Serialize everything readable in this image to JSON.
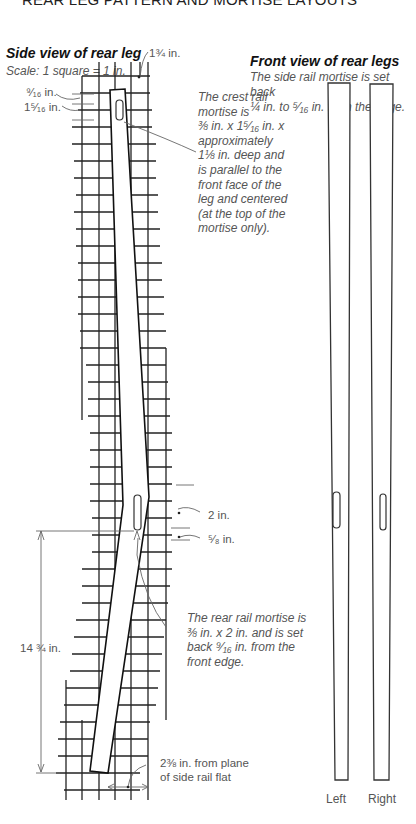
{
  "page_title": "REAR LEG PATTERN AND MORTISE LAYOUTS",
  "side_view": {
    "heading": "Side view of rear leg",
    "scale": "Scale: 1 square = 1 in.",
    "labels": {
      "top_width": "1¾ in.",
      "top_offset_a": "⁹⁄₁₆ in.",
      "top_offset_b": "1⁵⁄₁₆ in.",
      "rear_mortise_length": "2 in.",
      "rear_mortise_offset": "⁵⁄₈ in.",
      "height": "14 ¾ in.",
      "foot_offset_line1": "2⅜ in. from plane",
      "foot_offset_line2": "of side rail flat"
    },
    "crest_note": [
      "The crest rail",
      "mortise is",
      "⅜ in. x 1⁵⁄₁₆ in. x",
      "approximately",
      "1⅛ in. deep and",
      "is parallel to the",
      "front face of the",
      "leg and centered",
      "(at the top of the",
      "mortise only)."
    ],
    "rear_note": [
      "The rear rail mortise is",
      "⅜ in. x 2 in. and is set",
      "back ⁹⁄₁₆ in. from the",
      "front edge."
    ]
  },
  "front_view": {
    "heading": "Front view of rear legs",
    "note": [
      "The side rail mortise is set back",
      "¼ in. to ⁵⁄₁₆ in. from the edge."
    ],
    "legs": [
      {
        "label": "Left"
      },
      {
        "label": "Right"
      }
    ]
  },
  "colors": {
    "ink": "#222222",
    "text": "#555555",
    "paper": "#ffffff"
  }
}
